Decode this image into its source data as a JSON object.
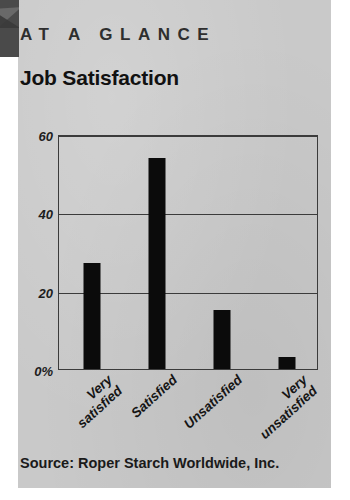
{
  "card": {
    "kicker": "AT A GLANCE",
    "corner_tab_icon": "triangle-tab-icon",
    "background_color": "#c9c9c9"
  },
  "source": {
    "text": "Source: Roper Starch Worldwide, Inc."
  },
  "chart_data": {
    "type": "bar",
    "title": "Job Satisfaction",
    "categories": [
      "Very satisfied",
      "Satisfied",
      "Unsatisfied",
      "Very unsatisfied"
    ],
    "category_lines": [
      [
        "Very",
        "satisfied"
      ],
      [
        "Satisfied"
      ],
      [
        "Unsatisfied"
      ],
      [
        "Very",
        "unsatisfied"
      ]
    ],
    "values": [
      27,
      54,
      15,
      3
    ],
    "xlabel": "",
    "ylabel": "",
    "ylim": [
      0,
      60
    ],
    "yticks": [
      0,
      20,
      40,
      60
    ],
    "ytick_labels": [
      "0%",
      "20",
      "40",
      "60"
    ],
    "grid": true,
    "legend": "none",
    "bar_color": "#0b0b0b",
    "axis_color": "#3b3b3b"
  }
}
